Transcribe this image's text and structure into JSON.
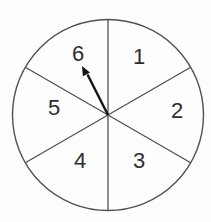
{
  "spinner": {
    "sectors": [
      {
        "label": "1",
        "x": 139,
        "y": 64
      },
      {
        "label": "2",
        "x": 177,
        "y": 118
      },
      {
        "label": "3",
        "x": 139,
        "y": 168
      },
      {
        "label": "4",
        "x": 80,
        "y": 168
      },
      {
        "label": "5",
        "x": 54,
        "y": 115
      },
      {
        "label": "6",
        "x": 78,
        "y": 61
      }
    ],
    "arrow": {
      "points_to_sector": "6"
    },
    "colors": {
      "outline": "#515151",
      "label": "#2e2e2e",
      "arrow": "#141414",
      "face": "#fdfdfd"
    }
  }
}
